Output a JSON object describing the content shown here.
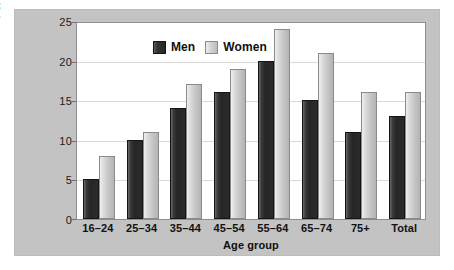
{
  "chart_data": {
    "type": "bar",
    "title": "",
    "xlabel": "Age group",
    "ylabel": "Percentage with BMI of over 30",
    "categories": [
      "16–24",
      "25–34",
      "35–44",
      "45–54",
      "55–64",
      "65–74",
      "75+",
      "Total"
    ],
    "series": [
      {
        "name": "Men",
        "values": [
          5,
          10,
          14,
          16,
          20,
          15,
          11,
          13
        ],
        "color": "#2b2b2b"
      },
      {
        "name": "Women",
        "values": [
          8,
          11,
          17,
          19,
          24,
          21,
          16,
          16
        ],
        "color": "#c6c6c6"
      }
    ],
    "ylim": [
      0,
      25
    ],
    "yticks": [
      0,
      5,
      10,
      15,
      20,
      25
    ],
    "ytick_labels": [
      "0",
      "5",
      "10",
      "15",
      "20",
      "25"
    ],
    "grid": true,
    "legend_position": "top-left-inside"
  },
  "legend": {
    "items": [
      {
        "label": "Men"
      },
      {
        "label": "Women"
      }
    ]
  },
  "colors": {
    "panel_background": "#c3c3c3",
    "plot_background": "#ffffff",
    "gridline": "#d9d9d9",
    "axis": "#8e8e8e",
    "text": "#111111"
  }
}
